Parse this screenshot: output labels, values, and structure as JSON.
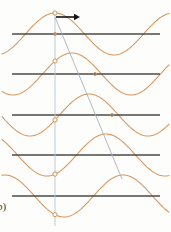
{
  "figure": {
    "panel_label": "b)",
    "width": 171,
    "height": 232,
    "background_color": "#fdfdfc"
  },
  "colors": {
    "wave": "#d89a62",
    "axis": "#4a4a4a",
    "reference_line": "#b9c4cf",
    "ray_line": "#a7b2be",
    "arrow": "#111111",
    "marker_stroke": "#c98a52",
    "marker_fill": "#fdfdfc",
    "label_text": "#3a3a3a"
  },
  "chart_data": {
    "type": "line",
    "title": "",
    "subtitle": "",
    "xlabel": "",
    "ylabel": "",
    "grid": false,
    "legend_position": "none",
    "xlim": [
      0,
      171
    ],
    "wave": {
      "amplitude_px": 21,
      "wavelength_px": 118,
      "samples_per_row": 180
    },
    "rows": [
      {
        "index": 0,
        "axis_y": 34,
        "axis_x_start": 12,
        "axis_x_end": 160,
        "phase_shift_px": 0,
        "marker_x": 55,
        "crest_x": 55
      },
      {
        "index": 1,
        "axis_y": 74,
        "axis_x_start": 12,
        "axis_x_end": 160,
        "phase_shift_px": 17,
        "marker_x": 55,
        "crest_x": 72
      },
      {
        "index": 2,
        "axis_y": 115,
        "axis_x_start": 12,
        "axis_x_end": 160,
        "phase_shift_px": 34,
        "marker_x": 55,
        "crest_x": 89
      },
      {
        "index": 3,
        "axis_y": 155,
        "axis_x_start": 12,
        "axis_x_end": 160,
        "phase_shift_px": 51,
        "marker_x": 55,
        "crest_x": 106
      },
      {
        "index": 4,
        "axis_y": 196,
        "axis_x_start": 12,
        "axis_x_end": 160,
        "phase_shift_px": 68,
        "marker_x": 55,
        "crest_x": 123
      }
    ],
    "reference_line": {
      "x": 55,
      "y_top": 14,
      "y_bottom": 226
    },
    "ray_line": {
      "x1": 55,
      "y1": 17,
      "x2": 122,
      "y2": 179
    },
    "propagation_arrow": {
      "x1": 56,
      "y1": 17,
      "x2": 80,
      "y2": 17,
      "direction": "right"
    },
    "axis_markers_x": [
      55,
      95,
      112
    ]
  }
}
